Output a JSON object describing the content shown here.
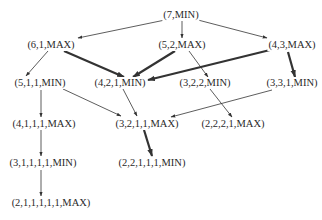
{
  "diagram": {
    "type": "game-tree",
    "colors": {
      "edge": "#333333",
      "text": "#2a2a2a",
      "background": "#ffffff"
    },
    "nodes": [
      {
        "id": "n7",
        "label": "(7,MIN)",
        "x": 181,
        "y": 15
      },
      {
        "id": "n61",
        "label": "(6,1,MAX)",
        "x": 51,
        "y": 45
      },
      {
        "id": "n52",
        "label": "(5,2,MAX)",
        "x": 182,
        "y": 45
      },
      {
        "id": "n43",
        "label": "(4,3,MAX)",
        "x": 292,
        "y": 45
      },
      {
        "id": "n511",
        "label": "(5,1,1,MIN)",
        "x": 40,
        "y": 83
      },
      {
        "id": "n421",
        "label": "(4,2,1,MIN)",
        "x": 120,
        "y": 83
      },
      {
        "id": "n322",
        "label": "(3,2,2,MIN)",
        "x": 205,
        "y": 83
      },
      {
        "id": "n331",
        "label": "(3,3,1,MIN)",
        "x": 292,
        "y": 83
      },
      {
        "id": "n4111",
        "label": "(4,1,1,1,MAX)",
        "x": 44,
        "y": 124
      },
      {
        "id": "n3211",
        "label": "(3,2,1,1,MAX)",
        "x": 147,
        "y": 124
      },
      {
        "id": "n2221",
        "label": "(2,2,2,1,MAX)",
        "x": 233,
        "y": 124
      },
      {
        "id": "n31111",
        "label": "(3,1,1,1,1,MIN)",
        "x": 43,
        "y": 163
      },
      {
        "id": "n22111",
        "label": "(2,2,1,1,1,MIN)",
        "x": 152,
        "y": 163
      },
      {
        "id": "n211111",
        "label": "(2,1,1,1,1,1,MAX)",
        "x": 51,
        "y": 203
      }
    ],
    "edges": [
      {
        "from": "n7",
        "to": "n61",
        "x1": 165,
        "y1": 20,
        "x2": 78,
        "y2": 38,
        "bold": false
      },
      {
        "from": "n7",
        "to": "n52",
        "x1": 182,
        "y1": 21,
        "x2": 182,
        "y2": 38,
        "bold": false
      },
      {
        "from": "n7",
        "to": "n43",
        "x1": 198,
        "y1": 20,
        "x2": 267,
        "y2": 38,
        "bold": false
      },
      {
        "from": "n61",
        "to": "n511",
        "x1": 48,
        "y1": 51,
        "x2": 26,
        "y2": 76,
        "bold": false
      },
      {
        "from": "n61",
        "to": "n421",
        "x1": 64,
        "y1": 51,
        "x2": 124,
        "y2": 77,
        "bold": true
      },
      {
        "from": "n52",
        "to": "n421",
        "x1": 175,
        "y1": 51,
        "x2": 133,
        "y2": 77,
        "bold": true
      },
      {
        "from": "n52",
        "to": "n322",
        "x1": 189,
        "y1": 51,
        "x2": 208,
        "y2": 77,
        "bold": false
      },
      {
        "from": "n43",
        "to": "n421",
        "x1": 270,
        "y1": 50,
        "x2": 148,
        "y2": 80,
        "bold": true
      },
      {
        "from": "n43",
        "to": "n331",
        "x1": 288,
        "y1": 52,
        "x2": 295,
        "y2": 77,
        "bold": true
      },
      {
        "from": "n511",
        "to": "n4111",
        "x1": 41,
        "y1": 90,
        "x2": 41,
        "y2": 117,
        "bold": false
      },
      {
        "from": "n511",
        "to": "n3211",
        "x1": 63,
        "y1": 89,
        "x2": 121,
        "y2": 116,
        "bold": false
      },
      {
        "from": "n421",
        "to": "n3211",
        "x1": 123,
        "y1": 89,
        "x2": 137,
        "y2": 116,
        "bold": false
      },
      {
        "from": "n331",
        "to": "n3211",
        "x1": 272,
        "y1": 90,
        "x2": 171,
        "y2": 117,
        "bold": false
      },
      {
        "from": "n322",
        "to": "n2221",
        "x1": 210,
        "y1": 89,
        "x2": 232,
        "y2": 117,
        "bold": false
      },
      {
        "from": "n4111",
        "to": "n31111",
        "x1": 41,
        "y1": 130,
        "x2": 41,
        "y2": 156,
        "bold": false
      },
      {
        "from": "n3211",
        "to": "n22111",
        "x1": 144,
        "y1": 130,
        "x2": 152,
        "y2": 156,
        "bold": true
      },
      {
        "from": "n31111",
        "to": "n211111",
        "x1": 41,
        "y1": 170,
        "x2": 41,
        "y2": 196,
        "bold": false
      }
    ]
  }
}
